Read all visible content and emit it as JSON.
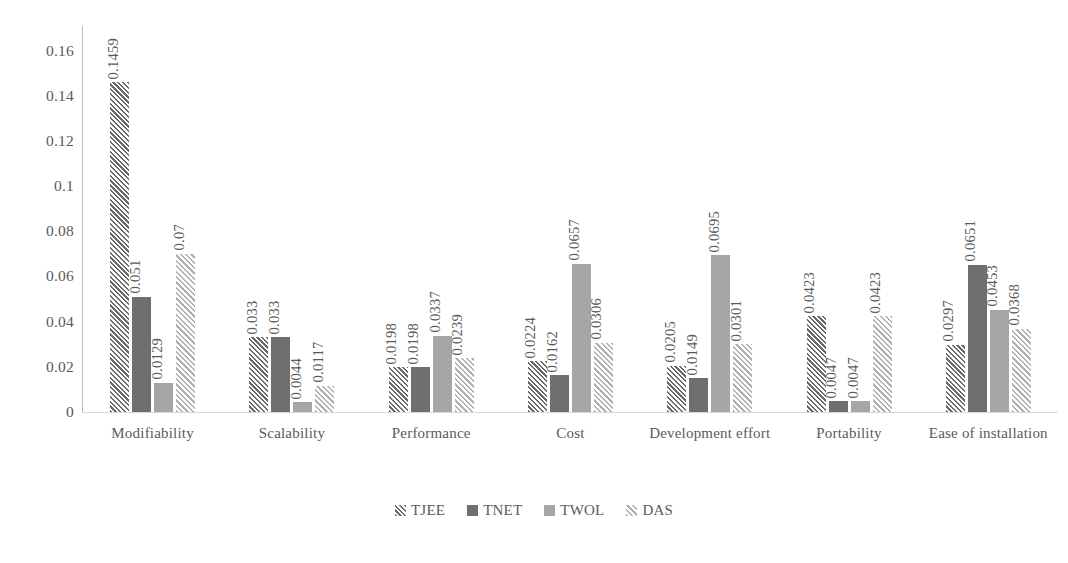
{
  "chart_data": {
    "type": "bar",
    "title": "",
    "subtitle": "",
    "xlabel": "",
    "ylabel": "",
    "ylim": [
      0,
      0.17
    ],
    "grid": false,
    "legend_position": "bottom",
    "y_ticks": [
      "0",
      "0.02",
      "0.04",
      "0.06",
      "0.08",
      "0.1",
      "0.12",
      "0.14",
      "0.16"
    ],
    "y_tick_values": [
      0,
      0.02,
      0.04,
      0.06,
      0.08,
      0.1,
      0.12,
      0.14,
      0.16
    ],
    "categories": [
      "Modifiability",
      "Scalability",
      "Performance",
      "Cost",
      "Development effort",
      "Portability",
      "Ease of installation"
    ],
    "series": [
      {
        "name": "TJEE",
        "pattern": "diagonal-hatch-dark",
        "color": "#6b6b6b",
        "values": [
          0.1459,
          0.033,
          0.0198,
          0.0224,
          0.0205,
          0.0423,
          0.0297
        ],
        "labels": [
          "0.1459",
          "0.033",
          "0.0198",
          "0.0224",
          "0.0205",
          "0.0423",
          "0.0297"
        ]
      },
      {
        "name": "TNET",
        "pattern": "solid-dark",
        "color": "#6f6f6f",
        "values": [
          0.051,
          0.033,
          0.0198,
          0.0162,
          0.0149,
          0.0047,
          0.0651
        ],
        "labels": [
          "0.051",
          "0.033",
          "0.0198",
          "0.0162",
          "0.0149",
          "0.0047",
          "0.0651"
        ]
      },
      {
        "name": "TWOL",
        "pattern": "solid-light",
        "color": "#a6a6a6",
        "values": [
          0.0129,
          0.0044,
          0.0337,
          0.0657,
          0.0695,
          0.0047,
          0.0453
        ],
        "labels": [
          "0.0129",
          "0.0044",
          "0.0337",
          "0.0657",
          "0.0695",
          "0.0047",
          "0.0453"
        ]
      },
      {
        "name": "DAS",
        "pattern": "diagonal-hatch-light",
        "color": "#b0b0b0",
        "values": [
          0.07,
          0.0117,
          0.0239,
          0.0306,
          0.0301,
          0.0423,
          0.0368
        ],
        "labels": [
          "0.07",
          "0.0117",
          "0.0239",
          "0.0306",
          "0.0301",
          "0.0423",
          "0.0368"
        ]
      }
    ]
  },
  "legend": {
    "items": [
      {
        "label": "TJEE"
      },
      {
        "label": "TNET"
      },
      {
        "label": "TWOL"
      },
      {
        "label": "DAS"
      }
    ]
  }
}
